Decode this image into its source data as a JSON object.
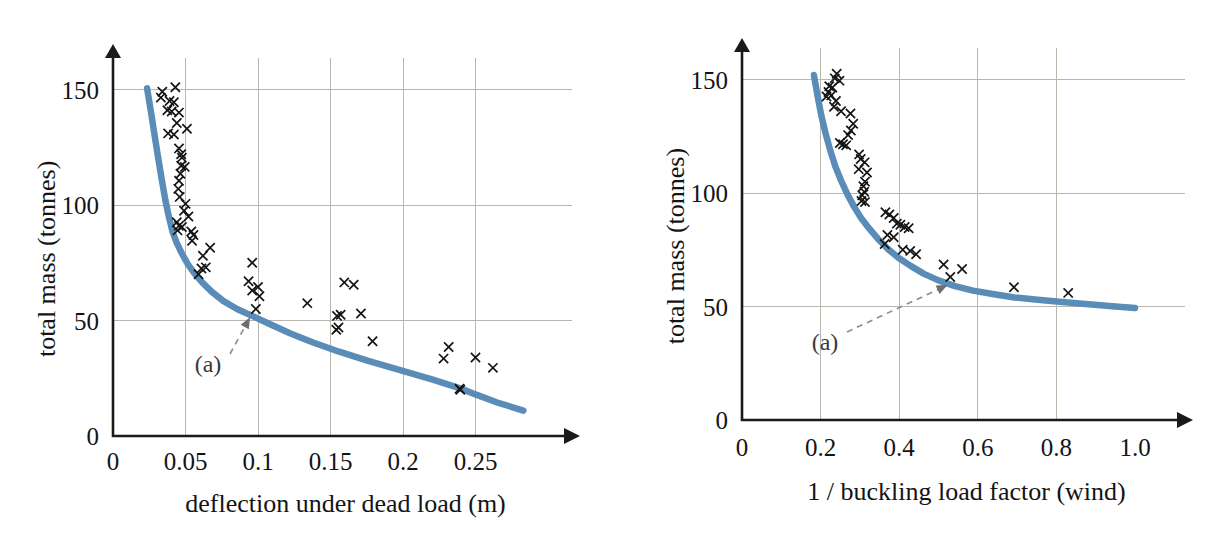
{
  "figure": {
    "panel_count": 2,
    "background_color": "#ffffff",
    "curve_color": "#5a8cb8",
    "marker_color": "#141414",
    "grid_color": "#b9b6ad",
    "axis_color": "#1a1a1a"
  },
  "chart_data": [
    {
      "panel": "left",
      "type": "scatter",
      "title": "",
      "xlabel": "deflection under dead load (m)",
      "ylabel": "total mass (tonnes)",
      "xlim": [
        0,
        0.29
      ],
      "ylim": [
        0,
        162
      ],
      "xticks": [
        0,
        0.05,
        0.1,
        0.15,
        0.2,
        0.25
      ],
      "xtick_labels": [
        "0",
        "0.05",
        "0.1",
        "0.15",
        "0.2",
        "0.25"
      ],
      "yticks": [
        0,
        50,
        100,
        150
      ],
      "ytick_labels": [
        "0",
        "50",
        "100",
        "150"
      ],
      "grid": true,
      "grid_x": [
        0.05,
        0.1,
        0.15,
        0.2,
        0.25
      ],
      "grid_y": [
        50,
        100,
        150
      ],
      "legend": "none",
      "series": [
        {
          "name": "optimum trade-off curve",
          "type": "line",
          "marker": "none",
          "color": "#5a8cb8",
          "annotation": "(a)",
          "points": [
            [
              0.0235,
              150.5
            ],
            [
              0.026,
              141.0
            ],
            [
              0.0285,
              131.0
            ],
            [
              0.031,
              121.0
            ],
            [
              0.0335,
              111.5
            ],
            [
              0.036,
              102.5
            ],
            [
              0.0385,
              95.0
            ],
            [
              0.041,
              88.5
            ],
            [
              0.044,
              83.5
            ],
            [
              0.0475,
              79.0
            ],
            [
              0.0515,
              74.5
            ],
            [
              0.056,
              70.5
            ],
            [
              0.0615,
              66.5
            ],
            [
              0.068,
              62.5
            ],
            [
              0.076,
              58.5
            ],
            [
              0.0855,
              55.0
            ],
            [
              0.096,
              52.0
            ],
            [
              0.108,
              48.5
            ],
            [
              0.122,
              44.5
            ],
            [
              0.138,
              40.5
            ],
            [
              0.156,
              36.5
            ],
            [
              0.176,
              32.5
            ],
            [
              0.198,
              28.5
            ],
            [
              0.22,
              24.5
            ],
            [
              0.24,
              20.5
            ],
            [
              0.25,
              18.0
            ],
            [
              0.265,
              14.5
            ],
            [
              0.283,
              11.0
            ]
          ]
        },
        {
          "name": "sampled designs",
          "type": "scatter",
          "marker": "x",
          "color": "#141414",
          "points": [
            [
              0.034,
              149.0
            ],
            [
              0.033,
              146.5
            ],
            [
              0.043,
              151.0
            ],
            [
              0.039,
              145.0
            ],
            [
              0.042,
              144.5
            ],
            [
              0.0375,
              141.0
            ],
            [
              0.0405,
              140.5
            ],
            [
              0.0455,
              140.0
            ],
            [
              0.044,
              135.5
            ],
            [
              0.038,
              131.0
            ],
            [
              0.042,
              130.5
            ],
            [
              0.051,
              133.0
            ],
            [
              0.0455,
              124.5
            ],
            [
              0.047,
              122.0
            ],
            [
              0.0475,
              120.5
            ],
            [
              0.047,
              117.0
            ],
            [
              0.0495,
              116.5
            ],
            [
              0.0465,
              113.5
            ],
            [
              0.0455,
              110.5
            ],
            [
              0.045,
              107.0
            ],
            [
              0.046,
              103.5
            ],
            [
              0.05,
              100.5
            ],
            [
              0.049,
              97.5
            ],
            [
              0.052,
              95.0
            ],
            [
              0.044,
              92.5
            ],
            [
              0.0455,
              91.0
            ],
            [
              0.0475,
              90.5
            ],
            [
              0.0445,
              89.0
            ],
            [
              0.054,
              88.5
            ],
            [
              0.0555,
              87.0
            ],
            [
              0.0545,
              84.5
            ],
            [
              0.067,
              81.5
            ],
            [
              0.062,
              78.0
            ],
            [
              0.061,
              72.5
            ],
            [
              0.064,
              73.0
            ],
            [
              0.059,
              70.0
            ],
            [
              0.096,
              75.0
            ],
            [
              0.0935,
              67.0
            ],
            [
              0.1,
              64.5
            ],
            [
              0.096,
              63.0
            ],
            [
              0.101,
              60.5
            ],
            [
              0.0985,
              55.0
            ],
            [
              0.134,
              57.5
            ],
            [
              0.1595,
              66.5
            ],
            [
              0.166,
              65.5
            ],
            [
              0.157,
              52.5
            ],
            [
              0.1545,
              52.0
            ],
            [
              0.171,
              53.0
            ],
            [
              0.1555,
              47.0
            ],
            [
              0.154,
              46.0
            ],
            [
              0.179,
              41.0
            ],
            [
              0.2315,
              38.5
            ],
            [
              0.228,
              33.5
            ],
            [
              0.25,
              34.0
            ],
            [
              0.262,
              29.5
            ],
            [
              0.239,
              20.5
            ],
            [
              0.2395,
              20.0
            ]
          ]
        }
      ]
    },
    {
      "panel": "right",
      "type": "scatter",
      "title": "",
      "xlabel": "1 / buckling load factor (wind)",
      "ylabel": "total mass (tonnes)",
      "xlim": [
        0,
        1.04
      ],
      "ylim": [
        0,
        162
      ],
      "xticks": [
        0,
        0.2,
        0.4,
        0.6,
        0.8,
        1.0
      ],
      "xtick_labels": [
        "0",
        "0.2",
        "0.4",
        "0.6",
        "0.8",
        "1.0"
      ],
      "yticks": [
        0,
        50,
        100,
        150
      ],
      "ytick_labels": [
        "0",
        "50",
        "100",
        "150"
      ],
      "grid": true,
      "grid_x": [
        0.2,
        0.4,
        0.6,
        0.8
      ],
      "grid_y": [
        50,
        100,
        150
      ],
      "legend": "none",
      "series": [
        {
          "name": "optimum trade-off curve",
          "type": "line",
          "marker": "none",
          "color": "#5a8cb8",
          "annotation": "(a)",
          "points": [
            [
              0.183,
              152.0
            ],
            [
              0.192,
              143.0
            ],
            [
              0.202,
              134.0
            ],
            [
              0.213,
              126.0
            ],
            [
              0.225,
              118.5
            ],
            [
              0.238,
              111.5
            ],
            [
              0.252,
              105.5
            ],
            [
              0.268,
              99.5
            ],
            [
              0.285,
              94.0
            ],
            [
              0.303,
              89.0
            ],
            [
              0.323,
              84.5
            ],
            [
              0.345,
              80.0
            ],
            [
              0.37,
              75.5
            ],
            [
              0.398,
              71.5
            ],
            [
              0.428,
              68.0
            ],
            [
              0.462,
              64.5
            ],
            [
              0.5,
              61.5
            ],
            [
              0.542,
              59.0
            ],
            [
              0.588,
              57.0
            ],
            [
              0.638,
              55.5
            ],
            [
              0.693,
              54.0
            ],
            [
              0.752,
              53.0
            ],
            [
              0.815,
              52.0
            ],
            [
              0.882,
              51.0
            ],
            [
              0.95,
              50.0
            ],
            [
              1.0,
              49.3
            ]
          ]
        },
        {
          "name": "sampled designs",
          "type": "scatter",
          "marker": "x",
          "color": "#141414",
          "points": [
            [
              0.241,
              152.5
            ],
            [
              0.236,
              150.5
            ],
            [
              0.248,
              149.5
            ],
            [
              0.222,
              147.0
            ],
            [
              0.23,
              146.5
            ],
            [
              0.22,
              144.5
            ],
            [
              0.227,
              143.0
            ],
            [
              0.215,
              142.5
            ],
            [
              0.239,
              140.5
            ],
            [
              0.234,
              138.0
            ],
            [
              0.252,
              136.0
            ],
            [
              0.276,
              135.0
            ],
            [
              0.283,
              130.5
            ],
            [
              0.277,
              127.5
            ],
            [
              0.27,
              125.5
            ],
            [
              0.249,
              122.0
            ],
            [
              0.257,
              121.5
            ],
            [
              0.265,
              121.0
            ],
            [
              0.298,
              117.0
            ],
            [
              0.302,
              115.0
            ],
            [
              0.312,
              113.5
            ],
            [
              0.297,
              110.5
            ],
            [
              0.318,
              109.0
            ],
            [
              0.313,
              105.0
            ],
            [
              0.309,
              103.0
            ],
            [
              0.311,
              100.5
            ],
            [
              0.306,
              99.0
            ],
            [
              0.304,
              96.5
            ],
            [
              0.313,
              96.0
            ],
            [
              0.365,
              91.5
            ],
            [
              0.375,
              90.5
            ],
            [
              0.386,
              89.0
            ],
            [
              0.394,
              86.5
            ],
            [
              0.403,
              86.0
            ],
            [
              0.414,
              85.0
            ],
            [
              0.424,
              84.5
            ],
            [
              0.37,
              81.5
            ],
            [
              0.386,
              80.5
            ],
            [
              0.363,
              77.5
            ],
            [
              0.409,
              75.0
            ],
            [
              0.428,
              74.5
            ],
            [
              0.443,
              73.0
            ],
            [
              0.513,
              68.5
            ],
            [
              0.56,
              66.5
            ],
            [
              0.53,
              63.0
            ],
            [
              0.692,
              58.5
            ],
            [
              0.83,
              56.0
            ]
          ]
        }
      ]
    }
  ],
  "annotations": [
    {
      "panel": "left",
      "text": "(a)",
      "target_x": 0.0955,
      "target_y": 52.5
    },
    {
      "panel": "right",
      "text": "(a)",
      "target_x": 0.53,
      "target_y": 60.0
    }
  ]
}
